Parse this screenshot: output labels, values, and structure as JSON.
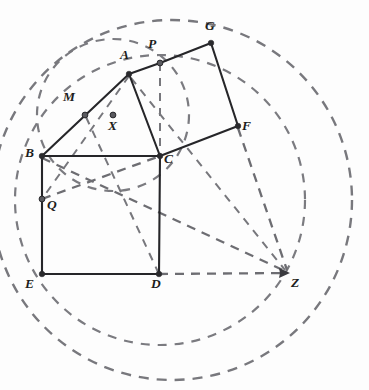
{
  "figure": {
    "background_color": "#fdfdfd",
    "solid_line_color": "#262629",
    "dashed_line_color": "#6d6d72",
    "label_color": "#1d1d20"
  },
  "points": [
    {
      "id": "A",
      "label": "A",
      "x": 129,
      "y": 74,
      "label_x": 120,
      "label_y": 55,
      "dot": true,
      "kind": "vertex"
    },
    {
      "id": "B",
      "label": "B",
      "x": 42,
      "y": 156,
      "label_x": 26,
      "label_y": 152,
      "dot": true,
      "kind": "vertex"
    },
    {
      "id": "C",
      "label": "C",
      "x": 160,
      "y": 156,
      "label_x": 165,
      "label_y": 156,
      "dot": true,
      "kind": "vertex"
    },
    {
      "id": "D",
      "label": "D",
      "x": 159,
      "y": 274,
      "label_x": 152,
      "label_y": 279,
      "dot": true,
      "kind": "vertex"
    },
    {
      "id": "E",
      "label": "E",
      "x": 42,
      "y": 274,
      "label_x": 25,
      "label_y": 279,
      "dot": true,
      "kind": "vertex"
    },
    {
      "id": "F",
      "label": "F",
      "x": 238,
      "y": 126,
      "label_x": 243,
      "label_y": 123,
      "dot": true,
      "kind": "vertex"
    },
    {
      "id": "G",
      "label": "G",
      "x": 211,
      "y": 43,
      "label_x": 205,
      "label_y": 22,
      "dot": true,
      "kind": "vertex"
    },
    {
      "id": "M",
      "label": "M",
      "x": 85,
      "y": 115,
      "label_x": 66,
      "label_y": 95,
      "dot": true,
      "kind": "midpoint"
    },
    {
      "id": "P",
      "label": "P",
      "x": 160,
      "y": 63,
      "label_x": 150,
      "label_y": 43,
      "dot": true,
      "kind": "midpoint"
    },
    {
      "id": "Q",
      "label": "Q",
      "x": 42,
      "y": 199,
      "label_x": 49,
      "label_y": 200,
      "dot": true,
      "kind": "intersection"
    },
    {
      "id": "X",
      "label": "X",
      "x": 113,
      "y": 115,
      "label_x": 107,
      "label_y": 122,
      "dot": true,
      "kind": "center"
    },
    {
      "id": "Z",
      "label": "Z",
      "x": 288,
      "y": 273,
      "label_x": 291,
      "label_y": 279,
      "dot": false,
      "kind": "arrow-target"
    }
  ],
  "solid_segments": [
    {
      "name": "segment-A-B",
      "from": "A",
      "to": "B"
    },
    {
      "name": "segment-A-C",
      "from": "A",
      "to": "C"
    },
    {
      "name": "segment-B-C",
      "from": "B",
      "to": "C"
    },
    {
      "name": "segment-B-E",
      "from": "B",
      "to": "E"
    },
    {
      "name": "segment-E-D",
      "from": "E",
      "to": "D"
    },
    {
      "name": "segment-D-C",
      "from": "D",
      "to": "C"
    },
    {
      "name": "segment-A-P",
      "from": "A",
      "to": "P"
    },
    {
      "name": "segment-P-G",
      "from": "P",
      "to": "G"
    },
    {
      "name": "segment-G-F",
      "from": "G",
      "to": "F"
    },
    {
      "name": "segment-F-C",
      "from": "F",
      "to": "C"
    }
  ],
  "dashed_segments": [
    {
      "name": "dashed-P-C",
      "from": "P",
      "to": "C",
      "style": "thin"
    },
    {
      "name": "dashed-Q-C",
      "from": "Q",
      "to": "C",
      "style": "chord"
    },
    {
      "name": "dashed-D-Z",
      "from": "D",
      "to": "Z",
      "style": "chord",
      "arrow": true
    },
    {
      "name": "dashed-B-Z",
      "from": "B",
      "to": "Z",
      "style": "chord",
      "arrow": true
    },
    {
      "name": "dashed-A-Z",
      "from": "A",
      "to": "Z",
      "style": "thin",
      "arrow": true
    },
    {
      "name": "dashed-F-Z",
      "from": "F",
      "to": "Z",
      "style": "chord",
      "arrow": true
    },
    {
      "name": "dashed-M-D",
      "from": "M",
      "to": "D",
      "style": "thin"
    },
    {
      "name": "dashed-A-Q",
      "from": "A",
      "to": "Q",
      "style": "thin"
    }
  ],
  "circles": [
    {
      "name": "circumcircle-ABC",
      "center_x": 113,
      "center_y": 115,
      "radius": 76,
      "style": "small"
    },
    {
      "name": "circle-through-P-F",
      "center_x": 160,
      "center_y": 200,
      "radius": 145,
      "style": "small"
    },
    {
      "name": "large-circle-through-G-E-Z",
      "center_x": 172,
      "center_y": 200,
      "radius": 180,
      "style": "large"
    }
  ],
  "notes": {
    "shape_square_lower": "BCDE",
    "shape_square_upper": "A P G F C region",
    "triangle": "ABC"
  }
}
